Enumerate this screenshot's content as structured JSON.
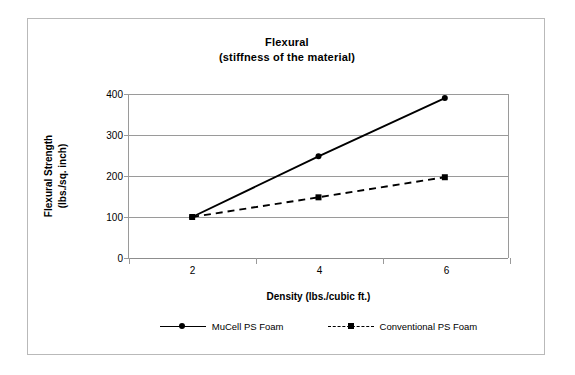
{
  "chart_data": {
    "type": "line",
    "title": "Flexural",
    "subtitle": "(stiffness of the material)",
    "xlabel": "Density (lbs./cubic ft.)",
    "ylabel_line1": "Flexural Strength",
    "ylabel_line2": "(lbs./sq. inch)",
    "categories": [
      "2",
      "4",
      "6"
    ],
    "x": [
      2,
      4,
      6
    ],
    "xlim": [
      1,
      7
    ],
    "ylim": [
      0,
      400
    ],
    "yticks": [
      "0",
      "100",
      "200",
      "300",
      "400"
    ],
    "ytick_values": [
      0,
      100,
      200,
      300,
      400
    ],
    "grid": true,
    "legend_position": "bottom",
    "series": [
      {
        "name": "MuCell PS Foam",
        "values": [
          100,
          248,
          390
        ],
        "style": "solid",
        "marker": "circle",
        "color": "#000000"
      },
      {
        "name": "Conventional PS Foam",
        "values": [
          100,
          148,
          197
        ],
        "style": "dashed",
        "marker": "square",
        "color": "#000000"
      }
    ]
  },
  "colors": {
    "axis": "#9a9a9a",
    "frame": "#b9b9b9",
    "ink": "#000000",
    "background": "#ffffff"
  }
}
